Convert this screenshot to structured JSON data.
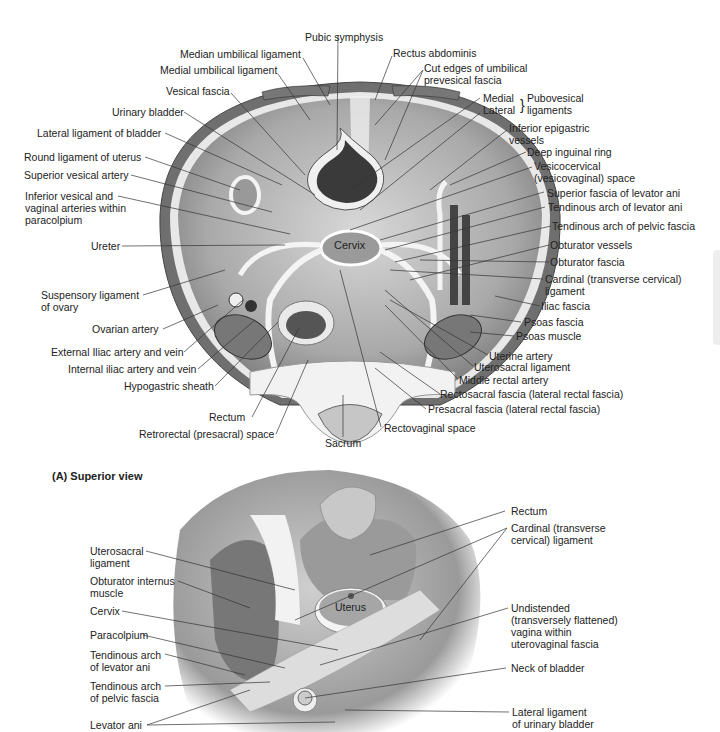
{
  "figure": {
    "panel_a_caption": "(A) Superior view",
    "top_diagram_center_labels": {
      "cervix": "Cervix",
      "sacrum": "Sacrum"
    },
    "bottom_diagram_center_labels": {
      "uterus": "Uterus"
    }
  },
  "top_labels": {
    "pubic_symphysis": "Pubic symphysis",
    "median_umbilical_ligament": "Median umbilical ligament",
    "medial_umbilical_ligament": "Medial umbilical ligament",
    "vesical_fascia": "Vesical fascia",
    "urinary_bladder": "Urinary bladder",
    "lateral_ligament_of_bladder": "Lateral ligament of bladder",
    "round_ligament_of_uterus": "Round ligament of uterus",
    "superior_vesical_artery": "Superior vesical artery",
    "inferior_vesical_1": "Inferior vesical and",
    "inferior_vesical_2": "vaginal arteries within",
    "inferior_vesical_3": "paracolpium",
    "ureter": "Ureter",
    "suspensory_1": "Suspensory ligament",
    "suspensory_2": "of ovary",
    "ovarian_artery": "Ovarian artery",
    "external_iliac": "External Iliac artery and vein",
    "internal_iliac": "Internal iliac artery and vein",
    "hypogastric_sheath": "Hypogastric sheath",
    "rectum": "Rectum",
    "retrorectal": "Retrorectal (presacral) space",
    "rectus_abdominis": "Rectus abdominis",
    "cut_edges_1": "Cut edges of umbilical",
    "cut_edges_2": "prevesical fascia",
    "medial": "Medial",
    "lateral": "Lateral",
    "pubovesical_1": "Pubovesical",
    "pubovesical_2": "ligaments",
    "inferior_epigastric_1": "Inferior epigastric",
    "inferior_epigastric_2": "vessels",
    "deep_inguinal_ring": "Deep inguinal ring",
    "vesicocervical_1": "Vesicocervical",
    "vesicocervical_2": "(vesicovaginal) space",
    "superior_fascia_levator": "Superior fascia of levator ani",
    "tendinous_arch_levator": "Tendinous arch of levator ani",
    "tendinous_arch_pelvic": "Tendinous arch of pelvic fascia",
    "obturator_vessels": "Obturator vessels",
    "obturator_fascia": "Obturator fascia",
    "cardinal_1": "Cardinal (transverse cervical)",
    "cardinal_2": "ligament",
    "iliac_fascia": "Iliac fascia",
    "psoas_fascia": "Psoas fascia",
    "psoas_muscle": "Psoas muscle",
    "uterine_artery": "Uterine artery",
    "uterosacral_ligament": "Uterosacral ligament",
    "middle_rectal_artery": "Middle rectal artery",
    "rectosacral_fascia": "Rectosacral fascia (lateral rectal fascia)",
    "presacral_fascia": "Presacral fascia (lateral rectal fascia)",
    "rectovaginal_space": "Rectovaginal space"
  },
  "bottom_labels": {
    "uterosacral_1": "Uterosacral",
    "uterosacral_2": "ligament",
    "obturator_internus_1": "Obturator internus",
    "obturator_internus_2": "muscle",
    "cervix": "Cervix",
    "paracolpium": "Paracolpium",
    "tal_1": "Tendinous arch",
    "tal_2": "of levator ani",
    "tapf_1": "Tendinous arch",
    "tapf_2": "of pelvic fascia",
    "levator_ani": "Levator ani",
    "rectum": "Rectum",
    "cardinal_1": "Cardinal (transverse",
    "cardinal_2": "cervical) ligament",
    "undistended_1": "Undistended",
    "undistended_2": "(transversely flattened)",
    "undistended_3": "vagina within",
    "undistended_4": "uterovaginal fascia",
    "neck_of_bladder": "Neck of bladder",
    "lat_lig_1": "Lateral ligament",
    "lat_lig_2": "of urinary bladder"
  }
}
